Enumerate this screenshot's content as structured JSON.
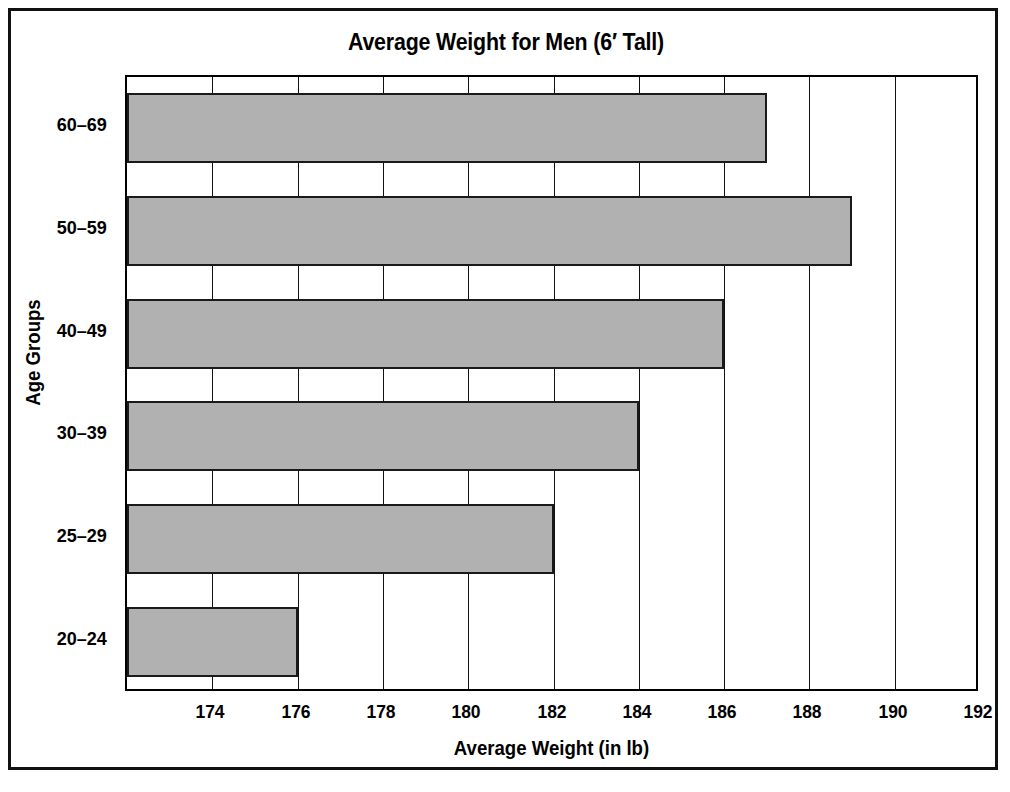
{
  "chart_data": {
    "type": "bar",
    "orientation": "horizontal",
    "title": "Average Weight for Men (6′ Tall)",
    "xlabel": "Average Weight (in lb)",
    "ylabel": "Age Groups",
    "categories": [
      "60–69",
      "50–59",
      "40–49",
      "30–39",
      "25–29",
      "20–24"
    ],
    "values": [
      187,
      189,
      186,
      184,
      182,
      176
    ],
    "xlim": [
      172,
      192
    ],
    "xticks": [
      174,
      176,
      178,
      180,
      182,
      184,
      186,
      188,
      190,
      192
    ],
    "xtick_labels": [
      "174",
      "176",
      "178",
      "180",
      "182",
      "184",
      "186",
      "188",
      "190",
      "192"
    ],
    "grid": "vertical",
    "legend": "none",
    "bar_fill": "#b1b1b1",
    "bar_edge": "#1a1a1a",
    "frame_color": "#111111",
    "background": "#ffffff"
  }
}
